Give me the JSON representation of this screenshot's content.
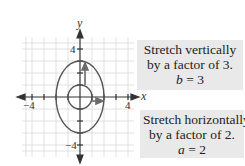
{
  "graph": {
    "x_axis_label": "x",
    "y_axis_label": "y",
    "tick_labels": {
      "x_neg": "−4",
      "x_pos": "4",
      "y_pos": "4",
      "y_neg": "−4"
    },
    "grid_range": [
      -4.5,
      4.5
    ],
    "circle_radius": 1,
    "ellipse": {
      "a": 2,
      "b": 3
    },
    "colors": {
      "grid": "#d6d6d6",
      "axes": "#333333",
      "curves": "#555555",
      "arrows": "#6a6a6a"
    }
  },
  "annotations": {
    "vertical": {
      "line1": "Stretch vertically",
      "line2": "by a factor of 3.",
      "var": "b",
      "eq_rest": " = 3"
    },
    "horizontal": {
      "line1": "Stretch horizontally",
      "line2": "by a factor of 2.",
      "var": "a",
      "eq_rest": " = 2"
    }
  }
}
